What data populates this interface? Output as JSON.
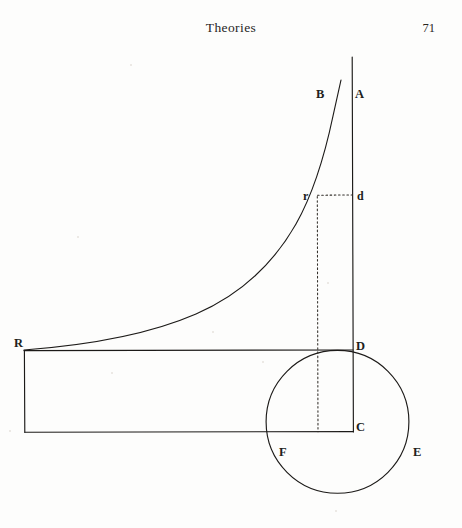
{
  "page": {
    "running_head": "Theories",
    "folio": "71",
    "background_color": "#fdfdfc",
    "ink_color": "#1c1a18"
  },
  "figure": {
    "name": "geometric-diagram",
    "labels": [
      {
        "id": "B",
        "text": "B",
        "x": 320,
        "y": 95,
        "role": "curve-top-label"
      },
      {
        "id": "A",
        "text": "A",
        "x": 358,
        "y": 95,
        "role": "vertical-axis-top-label"
      },
      {
        "id": "r",
        "text": "r",
        "x": 305,
        "y": 197,
        "role": "curve-point-label"
      },
      {
        "id": "d",
        "text": "d",
        "x": 359,
        "y": 197,
        "role": "axis-point-label"
      },
      {
        "id": "R",
        "text": "R",
        "x": 16,
        "y": 344,
        "role": "curve-left-end-label"
      },
      {
        "id": "D",
        "text": "D",
        "x": 357,
        "y": 347,
        "role": "intersection-label"
      },
      {
        "id": "C",
        "text": "C",
        "x": 357,
        "y": 427,
        "role": "axis-bottom-label"
      },
      {
        "id": "F",
        "text": "F",
        "x": 281,
        "y": 452,
        "role": "circle-lower-left-label"
      },
      {
        "id": "E",
        "text": "E",
        "x": 415,
        "y": 452,
        "role": "circle-right-label"
      }
    ],
    "geometry": {
      "vertical_axis": {
        "x": 353,
        "y_top": 57,
        "y_bottom": 432
      },
      "curve_rb": {
        "start": {
          "x": 24,
          "y": 350
        },
        "end": {
          "x": 341,
          "y": 80
        },
        "type": "asymptotic"
      },
      "rectangle": {
        "left": 24,
        "right": 353,
        "top": 350,
        "bottom": 432
      },
      "circle": {
        "cx": 337,
        "cy": 422,
        "r": 71
      },
      "dotted_horizontal": {
        "x1": 317,
        "x2": 353,
        "y": 195
      },
      "dotted_vertical": {
        "x": 317,
        "y1": 195,
        "y2": 432
      }
    }
  }
}
